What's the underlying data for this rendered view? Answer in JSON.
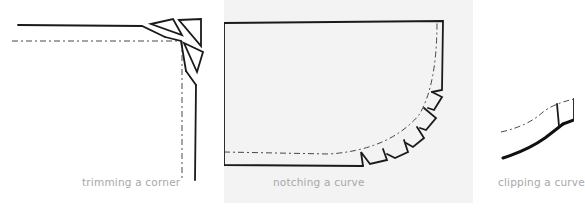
{
  "figures": [
    {
      "id": "trim-corner",
      "caption": "trimming a corner"
    },
    {
      "id": "notch-curve",
      "caption": "notching a curve"
    },
    {
      "id": "clip-curve",
      "caption": "clipping a curve"
    }
  ],
  "colors": {
    "background": "#ffffff",
    "middle_panel": "#f3f3f3",
    "caption_text": "#a8a8a8",
    "line": "#1a1a1a"
  }
}
